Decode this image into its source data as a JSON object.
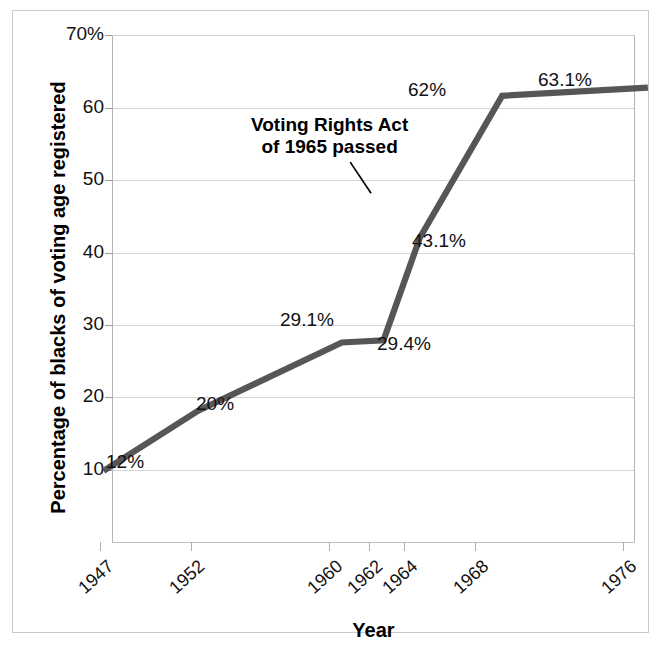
{
  "figure": {
    "border_color": "#c9c9c9",
    "background": "#ffffff"
  },
  "chart_data": {
    "type": "line",
    "title": "",
    "xlabel": "Year",
    "ylabel": "Percentage of blacks of voting age registered",
    "x": [
      1947,
      1952,
      1960,
      1962,
      1964,
      1968,
      1976
    ],
    "categories": [
      "1947",
      "1952",
      "1960",
      "1962",
      "1964",
      "1968",
      "1976"
    ],
    "values": [
      12,
      20,
      29.1,
      29.4,
      43.1,
      62,
      63.1
    ],
    "point_labels": [
      "12%",
      "20%",
      "29.1%",
      "29.4%",
      "43.1%",
      "62%",
      "63.1%"
    ],
    "series": [
      {
        "name": "Percentage of blacks of voting age registered",
        "color": "#565656",
        "values": [
          12,
          20,
          29.1,
          29.4,
          43.1,
          62,
          63.1
        ]
      }
    ],
    "ylim": [
      0,
      70
    ],
    "xlim": [
      1947,
      1976
    ],
    "yticks": [
      10,
      20,
      30,
      40,
      50,
      60,
      70
    ],
    "ytick_labels": [
      "10",
      "20",
      "30",
      "40",
      "50",
      "60",
      "70%"
    ],
    "xtick_labels": [
      "1947",
      "1952",
      "1960",
      "1962",
      "1964",
      "1968",
      "1976"
    ],
    "grid": "horizontal",
    "legend": "none",
    "line_color": "#565656",
    "line_width": 6,
    "annotations": [
      {
        "text_line1": "Voting Rights Act",
        "text_line2": "of 1965 passed",
        "points_to_year": 1965,
        "points_to_value": 53
      }
    ]
  },
  "axis": {
    "y_labels": [
      {
        "text": "70%",
        "value": 70
      },
      {
        "text": "60",
        "value": 60
      },
      {
        "text": "50",
        "value": 50
      },
      {
        "text": "40",
        "value": 40
      },
      {
        "text": "30",
        "value": 30
      },
      {
        "text": "20",
        "value": 20
      },
      {
        "text": "10",
        "value": 10
      }
    ],
    "x_labels": [
      {
        "text": "1947",
        "value": 1947
      },
      {
        "text": "1952",
        "value": 1952
      },
      {
        "text": "1960",
        "value": 1960
      },
      {
        "text": "1962",
        "value": 1962
      },
      {
        "text": "1964",
        "value": 1964
      },
      {
        "text": "1968",
        "value": 1968
      },
      {
        "text": "1976",
        "value": 1976
      }
    ],
    "x_title": "Year",
    "y_title": "Percentage of blacks of voting age registered"
  },
  "labels": {
    "p0": "12%",
    "p1": "20%",
    "p2": "29.1%",
    "p3": "29.4%",
    "p4": "43.1%",
    "p5": "62%",
    "p6": "63.1%"
  },
  "annotation": {
    "line1": "Voting Rights Act",
    "line2": "of 1965 passed"
  }
}
